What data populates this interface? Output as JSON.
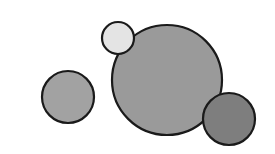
{
  "diagram": {
    "width": 275,
    "height": 154,
    "background": "#ffffff",
    "stroke_color": "#1a1a1a",
    "circles": [
      {
        "name": "large-circle",
        "cx": 167,
        "cy": 80,
        "r": 55,
        "fill": "#9a9a9a"
      },
      {
        "name": "small-light-circle",
        "cx": 118,
        "cy": 38,
        "r": 16,
        "fill": "#e4e4e4"
      },
      {
        "name": "left-circle",
        "cx": 68,
        "cy": 97,
        "r": 26,
        "fill": "#a2a2a2"
      },
      {
        "name": "bottom-right-circle",
        "cx": 229,
        "cy": 119,
        "r": 26,
        "fill": "#7e7e7e"
      }
    ]
  }
}
